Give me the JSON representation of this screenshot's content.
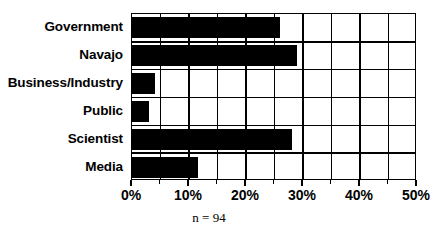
{
  "chart_data": {
    "type": "bar",
    "orientation": "horizontal",
    "title": "",
    "subtitle": "",
    "xlabel": "",
    "ylabel": "",
    "categories": [
      "Government",
      "Navajo",
      "Business/Industry",
      "Public",
      "Scientist",
      "Media"
    ],
    "values": [
      26,
      29,
      4,
      3,
      28,
      11.5
    ],
    "value_suffix": "%",
    "xlim": [
      0,
      50
    ],
    "xticks": [
      0,
      10,
      20,
      30,
      40,
      50
    ],
    "xtick_labels": [
      "0%",
      "10%",
      "20%",
      "30%",
      "40%",
      "50%"
    ],
    "minor_tick_step": 5,
    "grid": true,
    "grid_axis": "both",
    "legend": "none",
    "series": [
      {
        "name": "Percent of responses",
        "color": "#000000",
        "values": [
          26,
          29,
          4,
          3,
          28,
          11.5
        ]
      }
    ],
    "annotations": [
      {
        "name": "sample-size",
        "text": "n = 94"
      }
    ]
  },
  "caption": {
    "text": "n = 94"
  },
  "colors": {
    "bar": "#000000",
    "axis": "#000000",
    "grid": "#000000",
    "background": "#ffffff"
  }
}
